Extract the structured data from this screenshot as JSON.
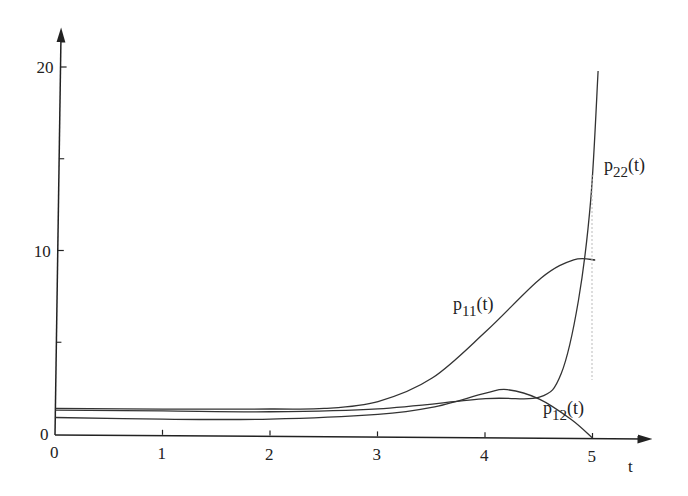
{
  "chart_data": {
    "type": "line",
    "title": "",
    "xlabel": "t",
    "ylabel": "",
    "xlim": [
      0,
      5.5
    ],
    "ylim": [
      0,
      21
    ],
    "x_ticks": [
      "0",
      "1",
      "2",
      "3",
      "4",
      "5"
    ],
    "y_ticks": [
      "0",
      "10",
      "20"
    ],
    "y_minor_ticks": [
      5,
      15
    ],
    "grid": false,
    "legend": "inline labels",
    "series": [
      {
        "name": "p11(t)",
        "label_main": "p",
        "label_sub": "11",
        "label_tail": "(t)",
        "x": [
          0,
          1,
          2,
          2.5,
          3,
          3.5,
          4,
          4.5,
          4.8,
          5
        ],
        "y": [
          1.4,
          1.4,
          1.45,
          1.5,
          1.9,
          3.2,
          5.8,
          8.7,
          9.7,
          9.7
        ]
      },
      {
        "name": "p12(t)",
        "label_main": "p",
        "label_sub": "12",
        "label_tail": "(t)",
        "x": [
          0,
          1,
          2,
          3,
          3.5,
          4,
          4.2,
          4.5,
          4.8,
          5
        ],
        "y": [
          0.9,
          0.85,
          0.9,
          1.2,
          1.6,
          2.4,
          2.6,
          2.1,
          1.0,
          0
        ]
      },
      {
        "name": "p22(t)",
        "label_main": "p",
        "label_sub": "22",
        "label_tail": "(t)",
        "x": [
          0,
          1,
          2,
          3,
          4,
          4.5,
          4.7,
          4.85,
          4.95,
          5
        ],
        "y": [
          1.3,
          1.3,
          1.3,
          1.5,
          2.1,
          2.2,
          3.5,
          7.5,
          13,
          20
        ]
      }
    ]
  }
}
